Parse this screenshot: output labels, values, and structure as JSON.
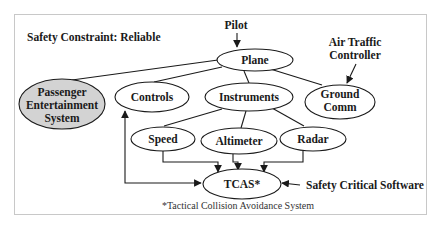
{
  "diagram": {
    "title": "Safety Constraint: Reliable",
    "footnote": "*Tactical Collision Avoidance System",
    "colors": {
      "stroke": "#1a1a1a",
      "node_fill": "#ffffff",
      "shaded_fill": "#d3d3d3",
      "frame": "#c8c8c8"
    },
    "external_actors": {
      "pilot": "Pilot",
      "atc_line1": "Air Traffic",
      "atc_line2": "Controller",
      "scs": "Safety Critical Software"
    },
    "nodes": {
      "plane": "Plane",
      "pes_line1": "Passenger",
      "pes_line2": "Entertainment",
      "pes_line3": "System",
      "controls": "Controls",
      "instruments": "Instruments",
      "ground_line1": "Ground",
      "ground_line2": "Comm",
      "speed": "Speed",
      "altimeter": "Altimeter",
      "radar": "Radar",
      "tcas": "TCAS*"
    },
    "edges": [
      {
        "from": "Pilot",
        "to": "Plane",
        "type": "arrow"
      },
      {
        "from": "Plane",
        "to": "Passenger Entertainment System",
        "type": "line"
      },
      {
        "from": "Plane",
        "to": "Controls",
        "type": "line"
      },
      {
        "from": "Plane",
        "to": "Instruments",
        "type": "line"
      },
      {
        "from": "Plane",
        "to": "Ground Comm",
        "type": "line"
      },
      {
        "from": "Air Traffic Controller",
        "to": "Ground Comm",
        "type": "arrow"
      },
      {
        "from": "Instruments",
        "to": "Speed",
        "type": "line"
      },
      {
        "from": "Instruments",
        "to": "Altimeter",
        "type": "line"
      },
      {
        "from": "Instruments",
        "to": "Radar",
        "type": "line"
      },
      {
        "from": "Speed",
        "to": "TCAS*",
        "type": "arrow"
      },
      {
        "from": "Altimeter",
        "to": "TCAS*",
        "type": "arrow"
      },
      {
        "from": "Radar",
        "to": "TCAS*",
        "type": "arrow"
      },
      {
        "from": "Controls",
        "to": "TCAS*",
        "type": "bidirectional"
      },
      {
        "from": "Safety Critical Software",
        "to": "TCAS*",
        "type": "arrow"
      }
    ]
  }
}
